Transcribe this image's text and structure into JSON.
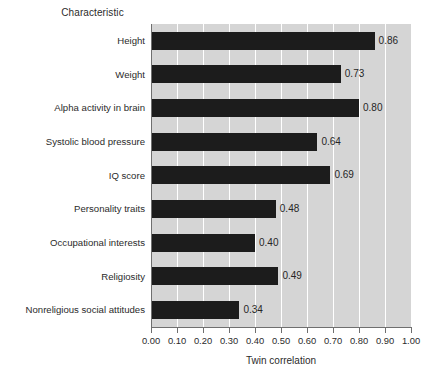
{
  "chart_data": {
    "type": "bar",
    "orientation": "horizontal",
    "title": "",
    "xlabel": "Twin correlation",
    "ylabel": "Characteristic",
    "xlim": [
      0.0,
      1.0
    ],
    "grid": true,
    "legend": null,
    "categories": [
      "Height",
      "Weight",
      "Alpha activity in brain",
      "Systolic blood pressure",
      "IQ score",
      "Personality traits",
      "Occupational interests",
      "Religiosity",
      "Nonreligious social attitudes"
    ],
    "values": [
      0.86,
      0.73,
      0.8,
      0.64,
      0.69,
      0.48,
      0.4,
      0.49,
      0.34
    ],
    "data_labels": [
      "0.86",
      "0.73",
      "0.80",
      "0.64",
      "0.69",
      "0.48",
      "0.40",
      "0.49",
      "0.34"
    ],
    "xticks": [
      0.0,
      0.1,
      0.2,
      0.3,
      0.4,
      0.5,
      0.6,
      0.7,
      0.8,
      0.9,
      1.0
    ],
    "xtick_labels": [
      "0.00",
      "0.10",
      "0.20",
      "0.30",
      "0.40",
      "0.50",
      "0.60",
      "0.70",
      "0.80",
      "0.90",
      "1.00"
    ],
    "colors": {
      "bar": "#1c1c1c",
      "plot_background": "#d5d5d5",
      "gridline": "#ffffff",
      "axis": "#6f6f6f",
      "text": "#2b2b2b",
      "figure_background": "#ffffff"
    }
  }
}
